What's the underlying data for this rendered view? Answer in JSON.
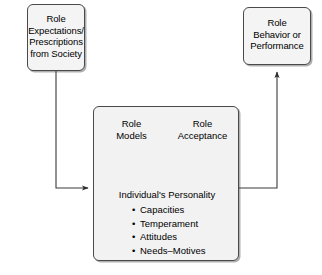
{
  "diagram": {
    "background_color": "#ffffff",
    "box_fill_color": "#f4f4f4",
    "box_border_color": "#4a4a4a",
    "line_color": "#333333",
    "nodes": {
      "role_expectations": {
        "line1": "Role",
        "line2": "Expectations/",
        "line3": "Prescriptions",
        "line4": "from Society"
      },
      "role_behavior": {
        "line1": "Role",
        "line2": "Behavior or",
        "line3": "Performance"
      },
      "individual": {
        "role_models_line1": "Role",
        "role_models_line2": "Models",
        "role_acceptance_line1": "Role",
        "role_acceptance_line2": "Acceptance",
        "personality_title": "Individual's Personality",
        "personality_items": [
          "Capacities",
          "Temperament",
          "Attitudes",
          "Needs–Motives"
        ]
      }
    },
    "connectors": [
      {
        "name": "expectations-to-individual",
        "from": "role_expectations",
        "to": "individual",
        "style": "elbow-down-right",
        "arrowhead": "end"
      },
      {
        "name": "individual-to-behavior",
        "from": "individual",
        "to": "role_behavior",
        "style": "elbow-right-up",
        "arrowhead": "end"
      },
      {
        "name": "personality-to-role-models",
        "from": "personality_title",
        "to": "role_models",
        "style": "diagonal",
        "arrowhead": "end"
      },
      {
        "name": "personality-to-role-acceptance",
        "from": "personality_title",
        "to": "role_acceptance",
        "style": "diagonal",
        "arrowhead": "end"
      }
    ]
  }
}
